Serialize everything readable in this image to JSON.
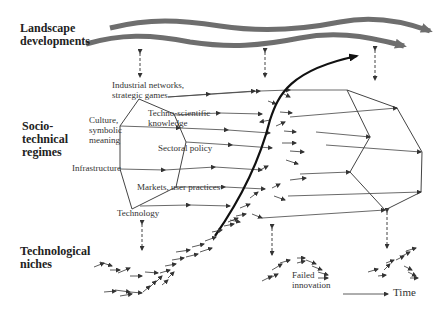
{
  "levels": {
    "landscape": "Landscape\ndevelopments",
    "regimes": "Socio-\ntechnical\nregimes",
    "niches": "Technological\nniches"
  },
  "regime_elements": {
    "industrial": "Industrial networks,\nstrategic games",
    "techno": "Techno-scientific\nknowledge",
    "culture": "Culture,\nsymbolic\nmeaning",
    "sectoral": "Sectoral policy",
    "infrastructure": "Infrastructure",
    "markets": "Markets, user practices",
    "technology": "Technology"
  },
  "annotations": {
    "failed": "Failed\ninnovation",
    "time": "Time"
  },
  "colors": {
    "landscape_wave": "#6e6e6e",
    "line": "#555555",
    "trajectory": "#111111",
    "text": "#222222"
  }
}
